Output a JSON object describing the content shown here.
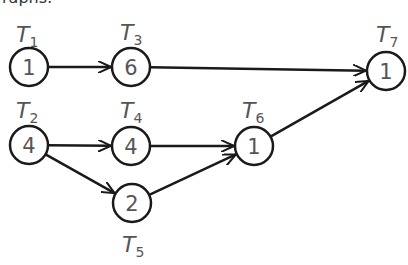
{
  "header": {
    "partial_text": "raphs:"
  },
  "nodes": [
    {
      "id": "T1",
      "label": "T",
      "sub": "1",
      "weight": "1",
      "cx": 29,
      "cy": 67,
      "lx": 16,
      "ly": 22
    },
    {
      "id": "T2",
      "label": "T",
      "sub": "2",
      "weight": "4",
      "cx": 29,
      "cy": 145,
      "lx": 16,
      "ly": 98
    },
    {
      "id": "T3",
      "label": "T",
      "sub": "3",
      "weight": "6",
      "cx": 131,
      "cy": 67,
      "lx": 120,
      "ly": 20
    },
    {
      "id": "T4",
      "label": "T",
      "sub": "4",
      "weight": "4",
      "cx": 131,
      "cy": 146,
      "lx": 120,
      "ly": 98
    },
    {
      "id": "T5",
      "label": "T",
      "sub": "5",
      "weight": "2",
      "cx": 132,
      "cy": 203,
      "lx": 122,
      "ly": 232
    },
    {
      "id": "T6",
      "label": "T",
      "sub": "6",
      "weight": "1",
      "cx": 254,
      "cy": 146,
      "lx": 242,
      "ly": 98
    },
    {
      "id": "T7",
      "label": "T",
      "sub": "7",
      "weight": "1",
      "cx": 386,
      "cy": 71,
      "lx": 376,
      "ly": 22
    }
  ],
  "edges": [
    {
      "from": "T1",
      "to": "T3"
    },
    {
      "from": "T3",
      "to": "T7"
    },
    {
      "from": "T2",
      "to": "T4"
    },
    {
      "from": "T2",
      "to": "T5"
    },
    {
      "from": "T4",
      "to": "T6"
    },
    {
      "from": "T5",
      "to": "T6"
    },
    {
      "from": "T6",
      "to": "T7"
    }
  ],
  "style": {
    "stroke": "#1a1a1a",
    "text": "#555555"
  }
}
